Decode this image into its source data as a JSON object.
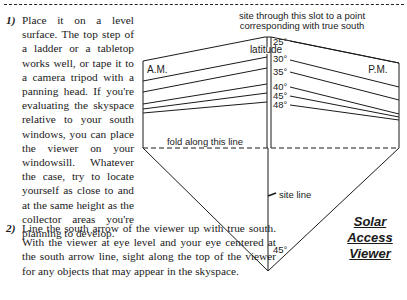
{
  "instructions": [
    {
      "number": "1)",
      "text": "Place it on a level surface. The top step of a ladder or a tabletop works well, or tape it to a camera tripod with a panning head. If you're evaluating the skyspace relative to your south windows, you can place the viewer on your windowsill. Whatever the case, try to locate yourself as close to and at the same height as the collector areas you're planning to develop."
    },
    {
      "number": "2)",
      "text": "Line the south arrow of the viewer up with true south. With the viewer at eye level and your eye centered at the south arrow line, sight along the top of the viewer for any objects that may appear in the skyspace."
    }
  ],
  "viewer_diagram": {
    "slot_caption_line1": "site through this slot to a point",
    "slot_caption_line2": "corresponding with true south",
    "latitude_label": "latitude",
    "am_label": "A.M.",
    "pm_label": "P.M.",
    "latitude_marks": [
      "25°",
      "30°",
      "35°",
      "40°",
      "45°",
      "48°"
    ],
    "fold_label": "fold along this line",
    "site_line_label": "site line",
    "angle_label": "45°"
  },
  "title": {
    "line1": "Solar",
    "line2": "Access",
    "line3": "Viewer"
  }
}
